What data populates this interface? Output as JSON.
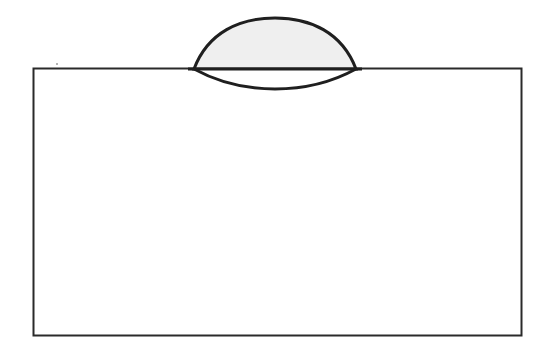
{
  "diagram": {
    "colors": {
      "stroke": "#1f1f1f",
      "lens_fill_upper": "#efefef",
      "lens_fill_lower": "#ffffff",
      "block_fill": "#ffffff",
      "background": "#ffffff"
    },
    "parts": [
      {
        "name": "upper-cap",
        "shape": "circular-arc dome above the surface"
      },
      {
        "name": "lower-cap",
        "shape": "shallow arc below the surface"
      },
      {
        "name": "interface-line",
        "shape": "horizontal line through the lens"
      },
      {
        "name": "block",
        "shape": "rectangle"
      }
    ]
  }
}
